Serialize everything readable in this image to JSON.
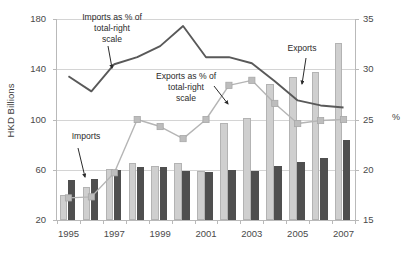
{
  "chart_data": {
    "type": "bar",
    "title": "",
    "xlabel": "",
    "ylabel": "HKD Billions",
    "y2label": "%",
    "ylim": [
      20,
      180
    ],
    "y2lim": [
      15,
      35
    ],
    "grid": true,
    "legend_position": "none",
    "categories": [
      "1995",
      "1996",
      "1997",
      "1998",
      "1999",
      "2000",
      "2001",
      "2002",
      "2003",
      "2004",
      "2005",
      "2006",
      "2007"
    ],
    "x_tick_labels": [
      "1995",
      "",
      "1997",
      "",
      "1999",
      "",
      "2001",
      "",
      "2003",
      "",
      "2005",
      "",
      "2007"
    ],
    "y_tick_labels": [
      "20",
      "60",
      "100",
      "140",
      "180"
    ],
    "y2_tick_labels": [
      "15",
      "20",
      "25",
      "30",
      "35"
    ],
    "series": [
      {
        "name": "Exports",
        "axis": "left",
        "type": "bar",
        "color": "#cfcfcf",
        "values": [
          40,
          46,
          61,
          65,
          63,
          65,
          59,
          97,
          101,
          128,
          134,
          138,
          161
        ]
      },
      {
        "name": "Imports",
        "axis": "left",
        "type": "bar",
        "color": "#4f4f4f",
        "values": [
          52,
          53,
          60,
          62,
          62,
          59,
          58,
          60,
          59,
          63,
          66,
          69,
          84
        ]
      },
      {
        "name": "Imports as % of total",
        "axis": "right",
        "type": "line",
        "color": "#595959",
        "values": [
          29.3,
          27.8,
          30.5,
          31.2,
          32.3,
          34.3,
          31.2,
          31.2,
          30.6,
          28.8,
          26.9,
          26.4,
          26.2
        ]
      },
      {
        "name": "Exports as % of total",
        "axis": "right",
        "type": "line",
        "color": "#b5b5b5",
        "marker": "square",
        "values": [
          17.2,
          17.3,
          19.7,
          25.0,
          24.3,
          23.1,
          25.0,
          28.4,
          28.9,
          26.6,
          24.6,
          24.9,
          25.0
        ]
      }
    ],
    "annotations": [
      {
        "name": "imports-pct-annotation",
        "text": "Imports as % of\ntotal-right\nscale",
        "line1": "Imports as % of",
        "line2": "total-right",
        "line3": "scale"
      },
      {
        "name": "exports-pct-annotation",
        "text": "Exports as % of\ntotal-right\nscale",
        "line1": "Exports as % of",
        "line2": "total-right",
        "line3": "scale"
      },
      {
        "name": "imports-annotation",
        "text": "Imports"
      },
      {
        "name": "exports-annotation",
        "text": "Exports"
      }
    ]
  },
  "axes": {
    "left_title": "HKD Billions",
    "right_title": "%"
  },
  "colors": {
    "export_bar": "#cfcfcf",
    "import_bar": "#4f4f4f",
    "import_line": "#595959",
    "export_line": "#b5b5b5",
    "grid": "#d4d4d4"
  }
}
